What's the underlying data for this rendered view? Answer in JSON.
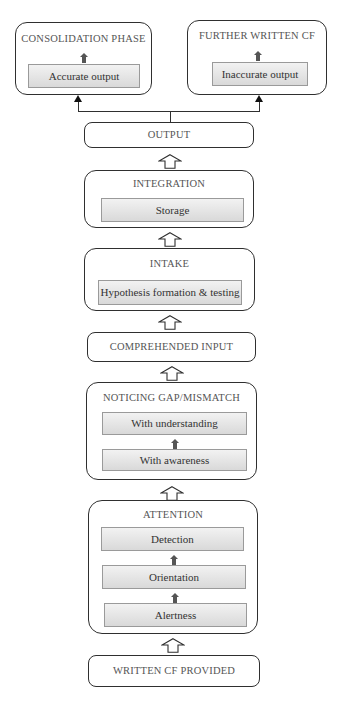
{
  "diagram": {
    "top_left": {
      "title": "CONSOLIDATION PHASE",
      "inner": "Accurate output"
    },
    "top_right": {
      "title": "FURTHER WRITTEN CF",
      "inner": "Inaccurate output"
    },
    "output": {
      "title": "OUTPUT"
    },
    "integration": {
      "title": "INTEGRATION",
      "inner": "Storage"
    },
    "intake": {
      "title": "INTAKE",
      "inner": "Hypothesis formation & testing"
    },
    "comprehended_input": {
      "title": "COMPREHENDED INPUT"
    },
    "noticing": {
      "title": "NOTICING GAP/MISMATCH",
      "inner": [
        "With understanding",
        "With awareness"
      ]
    },
    "attention": {
      "title": "ATTENTION",
      "inner": [
        "Detection",
        "Orientation",
        "Alertness"
      ]
    },
    "written_cf": {
      "title": "WRITTEN CF PROVIDED"
    }
  },
  "colors": {
    "border": "#2f2f2f",
    "inner_gradient_top": "#f2f2f2",
    "inner_gradient_bottom": "#d9d9d9",
    "solid_arrow": "#555555"
  }
}
